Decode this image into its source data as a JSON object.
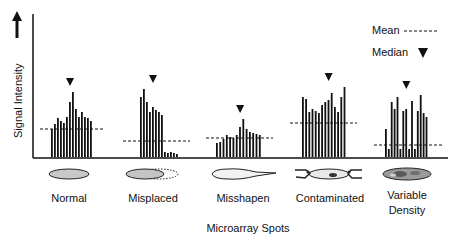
{
  "chart_data": {
    "type": "bar",
    "title": "",
    "xlabel": "Microarray Spots",
    "ylabel": "Signal Intensity",
    "legend": [
      {
        "label": "Mean",
        "symbol": "dashed-line"
      },
      {
        "label": "Median",
        "symbol": "down-triangle"
      }
    ],
    "legend_position": "top-right",
    "grid": false,
    "panels": [
      {
        "name": "Normal",
        "values": [
          28,
          33,
          39,
          36,
          34,
          40,
          55,
          65,
          48,
          40,
          45,
          40,
          39,
          36
        ],
        "min_bar_index": 0,
        "mean": 28,
        "median_x_index": 6
      },
      {
        "name": "Misplaced",
        "values": [
          60,
          68,
          55,
          45,
          50,
          47,
          45,
          42,
          5,
          4,
          5,
          4,
          3
        ],
        "mean": 16,
        "median_x_index": 4
      },
      {
        "name": "Misshapen",
        "values": [
          14,
          15,
          18,
          22,
          20,
          19,
          22,
          30,
          38,
          28,
          25,
          24,
          23,
          22
        ],
        "mean": 19,
        "median_x_index": 7
      },
      {
        "name": "Contaminated",
        "values": [
          60,
          58,
          45,
          48,
          46,
          44,
          52,
          55,
          57,
          64,
          50,
          45,
          60,
          70
        ],
        "mean": 34,
        "median_x_index": 8
      },
      {
        "name": "Variable Density",
        "values": [
          28,
          8,
          55,
          48,
          60,
          8,
          46,
          48,
          8,
          56,
          8,
          46,
          62,
          44,
          40
        ],
        "mean": 12,
        "median_x_index": 7
      }
    ]
  },
  "legend": {
    "mean_label": "Mean",
    "median_label": "Median"
  },
  "axes": {
    "y_label": "Signal Intensity",
    "x_label": "Microarray Spots"
  },
  "spots": [
    {
      "label": "Normal"
    },
    {
      "label": "Misplaced"
    },
    {
      "label": "Misshapen"
    },
    {
      "label": "Contaminated"
    },
    {
      "label_line1": "Variable",
      "label_line2": "Density"
    }
  ]
}
